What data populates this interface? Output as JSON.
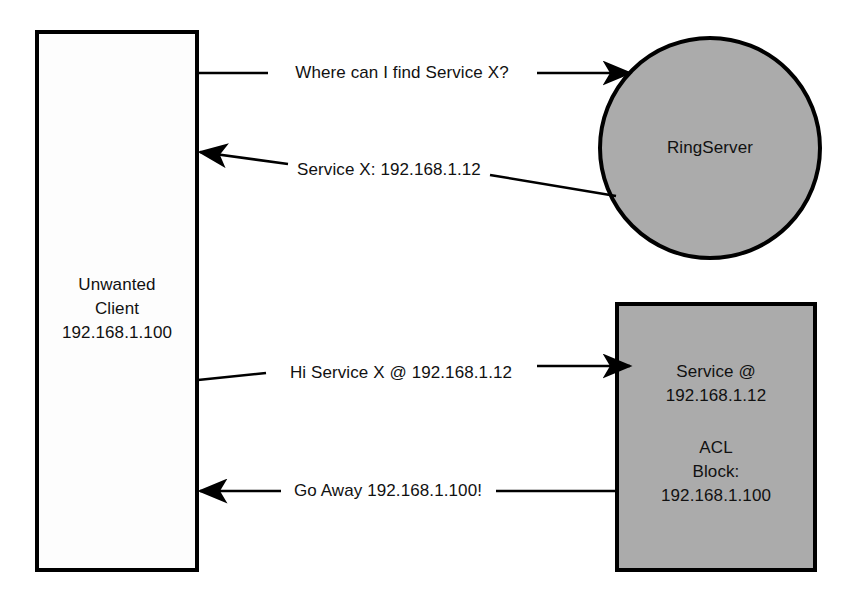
{
  "diagram": {
    "type": "network-sequence-diagram",
    "background_color": "#ffffff",
    "stroke_color": "#000000",
    "nodes": [
      {
        "id": "client",
        "shape": "rectangle",
        "name": "unwanted-client-node",
        "fill_color": "#fdfdfd",
        "lines": [
          "Unwanted",
          "Client",
          "192.168.1.100"
        ],
        "label": "Unwanted\nClient\n192.168.1.100"
      },
      {
        "id": "ringserver",
        "shape": "circle",
        "name": "ringserver-node",
        "fill_color": "#ababab",
        "lines": [
          "RingServer"
        ],
        "label": "RingServer"
      },
      {
        "id": "service",
        "shape": "rectangle",
        "name": "service-node",
        "fill_color": "#ababab",
        "lines": [
          "Service @",
          "192.168.1.12",
          "",
          "ACL",
          "Block:",
          "192.168.1.100"
        ],
        "label_top": "Service @\n192.168.1.12",
        "label_bottom": "ACL\nBlock:\n192.168.1.100"
      }
    ],
    "edges": [
      {
        "id": "e1",
        "name": "edge-client-to-ringserver-query",
        "from": "client",
        "to": "ringserver",
        "direction": "right",
        "label": "Where can I find Service X?"
      },
      {
        "id": "e2",
        "name": "edge-ringserver-to-client-reply",
        "from": "ringserver",
        "to": "client",
        "direction": "left",
        "label": "Service X: 192.168.1.12"
      },
      {
        "id": "e3",
        "name": "edge-client-to-service-hello",
        "from": "client",
        "to": "service",
        "direction": "right",
        "label": "Hi Service X @ 192.168.1.12"
      },
      {
        "id": "e4",
        "name": "edge-service-to-client-denial",
        "from": "service",
        "to": "client",
        "direction": "left",
        "label": "Go Away 192.168.1.100!"
      }
    ]
  }
}
